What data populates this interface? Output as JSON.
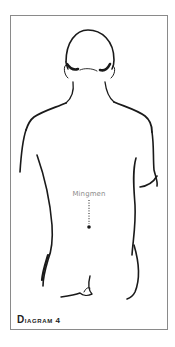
{
  "diagram": {
    "caption_first": "D",
    "caption_rest": "iagram 4",
    "point_label": "Mingmen",
    "colors": {
      "line": "#1a1a1a",
      "frame": "#8a8a8a",
      "label": "#8c8c8c"
    }
  }
}
